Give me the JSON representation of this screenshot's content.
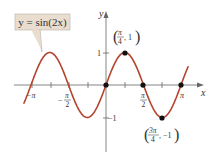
{
  "chart_data": {
    "type": "line",
    "title": "",
    "function_label": "y = sin(2x)",
    "xlabel": "x",
    "ylabel": "y",
    "xlim": [
      -3.14159,
      3.14159
    ],
    "ylim": [
      -1,
      1
    ],
    "x_ticks": [
      "-π",
      "-π/2",
      "π/2",
      "π"
    ],
    "y_ticks": [
      "1",
      "-1"
    ],
    "series": [
      {
        "name": "y = sin(2x)",
        "color": "#b5442e",
        "x": [
          -3.14159,
          -2.35619,
          -1.5708,
          -0.7854,
          0,
          0.7854,
          1.5708,
          2.35619,
          3.14159
        ],
        "values": [
          0,
          1,
          0,
          -1,
          0,
          1,
          0,
          -1,
          0
        ]
      }
    ],
    "highlighted_points": [
      {
        "x": "0",
        "y": "0"
      },
      {
        "x": "π/4",
        "y": "1",
        "label": "(π/4, 1)"
      },
      {
        "x": "π/2",
        "y": "0"
      },
      {
        "x": "3π/4",
        "y": "-1",
        "label": "(3π/4, −1)"
      },
      {
        "x": "π",
        "y": "0"
      }
    ],
    "grid": false,
    "legend": "callout box upper left"
  },
  "labels": {
    "callout": "y = sin(2x)",
    "x_axis": "x",
    "y_axis": "y",
    "tick_neg_pi": "−π",
    "tick_pi": "π",
    "tick_one": "1",
    "tick_neg_one": "−1",
    "point_max_num": "π",
    "point_max_den": "4",
    "point_max_y": ", 1",
    "point_min_num": "3π",
    "point_min_den": "4",
    "point_min_y": ", −1",
    "half_pi_num": "π",
    "half_pi_den": "2",
    "neg_half_pi_num": "π",
    "neg_half_pi_den": "2",
    "neg_sign": "−"
  },
  "colors": {
    "curve": "#b5442e",
    "axis": "#555555",
    "callout_fill": "#e9ddcf",
    "callout_border": "#bbb0a3"
  }
}
